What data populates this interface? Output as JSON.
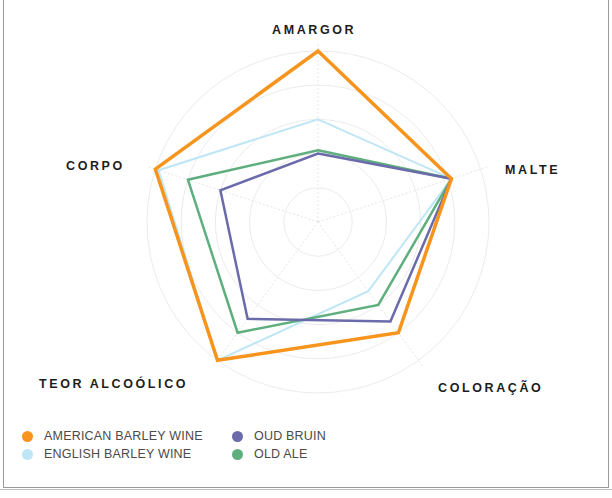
{
  "chart_data": {
    "type": "radar",
    "title": "",
    "axes": [
      "AMARGOR",
      "MALTE",
      "COLORAÇÃO",
      "TEOR ALCOÓLICO",
      "CORPO"
    ],
    "scale": {
      "min": 0,
      "max": 5,
      "rings": 5
    },
    "grid": true,
    "legend_position": "bottom-left",
    "series": [
      {
        "name": "AMERICAN BARLEY WINE",
        "color": "#f7941d",
        "values": [
          5,
          4.1,
          4,
          5,
          5
        ]
      },
      {
        "name": "ENGLISH BARLEY WINE",
        "color": "#bfe6f5",
        "values": [
          3,
          4.1,
          2.5,
          5,
          4.9
        ]
      },
      {
        "name": "OUD BRUIN",
        "color": "#6b6bab",
        "values": [
          2,
          4.1,
          3.6,
          3.5,
          3
        ]
      },
      {
        "name": "OLD ALE",
        "color": "#5fae7e",
        "values": [
          2.1,
          4.1,
          3,
          4,
          4
        ]
      }
    ]
  },
  "labels": {
    "amargor": "AMARGOR",
    "malte": "MALTE",
    "coloracao": "COLORAÇÃO",
    "teor": "TEOR ALCOÓLICO",
    "corpo": "CORPO"
  },
  "legend": [
    {
      "label": "AMERICAN BARLEY WINE",
      "color": "#f7941d"
    },
    {
      "label": "OUD BRUIN",
      "color": "#6b6bab"
    },
    {
      "label": "ENGLISH BARLEY WINE",
      "color": "#bfe6f5"
    },
    {
      "label": "OLD ALE",
      "color": "#5fae7e"
    }
  ]
}
